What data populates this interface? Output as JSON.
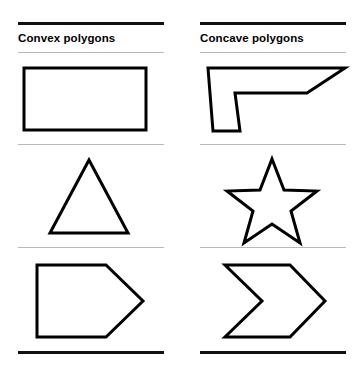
{
  "page": {
    "background": "#ffffff",
    "line_color": "#000000",
    "divider_color": "#b9b9b9",
    "shape_fill": "#ffffff",
    "shape_stroke": "#000000"
  },
  "columns": [
    {
      "id": "convex",
      "title": "Convex polygons",
      "shapes": [
        {
          "name": "rectangle",
          "label": "rectangle",
          "points": "6,13 128,13 128,75 6,75"
        },
        {
          "name": "triangle",
          "label": "triangle",
          "points": "71,14 110,87 32,87"
        },
        {
          "name": "pentagon",
          "label": "pentagon",
          "points": "19,16 88,16 125,52 88,88 19,88"
        }
      ]
    },
    {
      "id": "concave",
      "title": "Concave polygons",
      "shapes": [
        {
          "name": "l-shape",
          "label": "l-shape",
          "points": "8,13 145,13 107,38 35,38 40,76 13,76"
        },
        {
          "name": "star",
          "label": "five-pointed-star",
          "points": "72,13 84,44 117,45 91,65 100,97 72,78 44,97 53,65 27,45 60,44"
        },
        {
          "name": "chevron",
          "label": "chevron-arrow",
          "points": "25,16 90,16 125,52 90,88 25,88 62,52"
        }
      ]
    }
  ]
}
